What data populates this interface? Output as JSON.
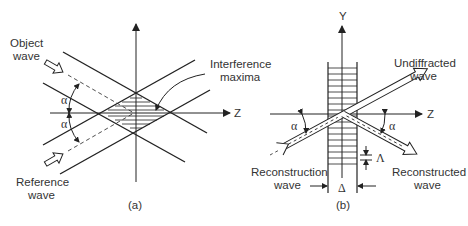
{
  "figure": {
    "panel_a": {
      "caption": "(a)",
      "labels": {
        "object_wave": [
          "Object",
          "wave"
        ],
        "reference_wave": [
          "Reference",
          "wave"
        ],
        "interference_maxima": [
          "Interference",
          "maxima"
        ],
        "axis_z": "Z",
        "angle_upper": "α",
        "angle_lower": "α"
      }
    },
    "panel_b": {
      "caption": "(b)",
      "labels": {
        "axis_y": "Y",
        "axis_z": "Z",
        "undiffracted_wave": [
          "Undiffracted",
          "wave"
        ],
        "reconstruction_wave": [
          "Reconstruction",
          "wave"
        ],
        "reconstructed_wave": [
          "Reconstructed",
          "wave"
        ],
        "angle_left": "α",
        "angle_right": "α",
        "fringe_spacing": "Λ",
        "thickness": "Δ"
      }
    },
    "colors": {
      "line": "#222222",
      "text": "#333333",
      "background": "#ffffff"
    }
  }
}
